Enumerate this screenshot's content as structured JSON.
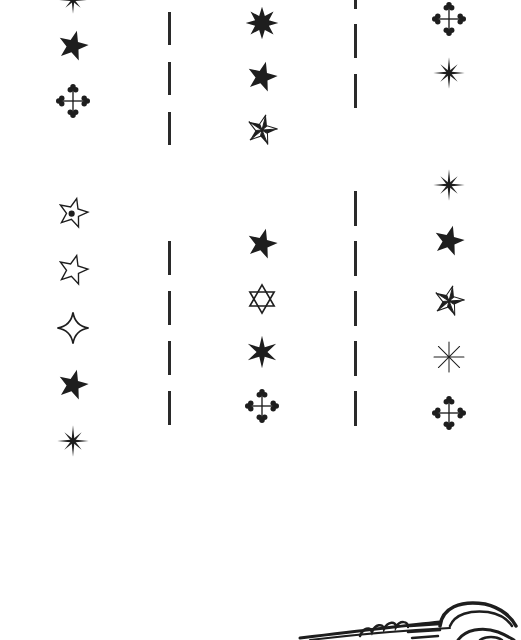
{
  "page": {
    "ink_color": "#1e1e1e",
    "paper_color": "#ffffff"
  },
  "columns": [
    {
      "name": "left",
      "x": 73,
      "icons": [
        {
          "type": "asterisk-8",
          "y": 0,
          "size": 30
        },
        {
          "type": "star-filled",
          "y": 46,
          "size": 34
        },
        {
          "type": "trefoil-cross",
          "y": 101,
          "size": 34
        },
        {
          "type": "star-outline-dot",
          "y": 213,
          "size": 34
        },
        {
          "type": "star-outline",
          "y": 270,
          "size": 34
        },
        {
          "type": "four-point-outline",
          "y": 328,
          "size": 34
        },
        {
          "type": "star-filled",
          "y": 385,
          "size": 34
        },
        {
          "type": "asterisk-8",
          "y": 441,
          "size": 34
        }
      ]
    },
    {
      "name": "middle",
      "x": 262,
      "icons": [
        {
          "type": "star-8-filled",
          "y": 23,
          "size": 34
        },
        {
          "type": "star-filled",
          "y": 77,
          "size": 34
        },
        {
          "type": "nautical-star",
          "y": 130,
          "size": 34
        },
        {
          "type": "star-filled",
          "y": 244,
          "size": 34
        },
        {
          "type": "hexagram-outline",
          "y": 299,
          "size": 32
        },
        {
          "type": "star-6-filled",
          "y": 352,
          "size": 34
        },
        {
          "type": "trefoil-cross",
          "y": 406,
          "size": 34
        }
      ]
    },
    {
      "name": "right",
      "x": 449,
      "icons": [
        {
          "type": "trefoil-cross",
          "y": 19,
          "size": 34
        },
        {
          "type": "asterisk-8",
          "y": 73,
          "size": 34
        },
        {
          "type": "asterisk-8",
          "y": 185,
          "size": 34
        },
        {
          "type": "star-filled",
          "y": 241,
          "size": 34
        },
        {
          "type": "nautical-star",
          "y": 301,
          "size": 34
        },
        {
          "type": "asterisk-outline",
          "y": 357,
          "size": 34
        },
        {
          "type": "trefoil-cross",
          "y": 413,
          "size": 34
        }
      ]
    }
  ],
  "dividers": [
    {
      "name": "divider-left",
      "x": 168,
      "dashes": [
        [
          12,
          45
        ],
        [
          62,
          95
        ],
        [
          112,
          145
        ],
        [
          241,
          275
        ],
        [
          291,
          325
        ],
        [
          341,
          375
        ],
        [
          391,
          425
        ]
      ]
    },
    {
      "name": "divider-right",
      "x": 354,
      "dashes": [
        [
          0,
          9
        ],
        [
          24,
          58
        ],
        [
          74,
          108
        ],
        [
          191,
          226
        ],
        [
          241,
          276
        ],
        [
          291,
          326
        ],
        [
          341,
          376
        ],
        [
          391,
          426
        ]
      ]
    }
  ],
  "footer_art": {
    "type": "partial-bird-drawing",
    "position": "bottom-right"
  }
}
